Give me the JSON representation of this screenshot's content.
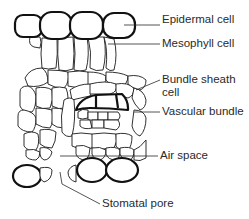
{
  "diagram": {
    "labels": {
      "epidermal": "Epidermal cell",
      "mesophyll": "Mesophyll cell",
      "bundle_sheath_1": "Bundle sheath",
      "bundle_sheath_2": "cell",
      "vascular": "Vascular bundle",
      "air_space": "Air space",
      "stomatal": "Stomatal pore"
    },
    "colors": {
      "stroke": "#1a1a1a",
      "text": "#2a2a2a",
      "background": "#ffffff"
    }
  }
}
